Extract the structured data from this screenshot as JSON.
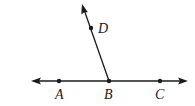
{
  "diagram": {
    "type": "geometry-lines-angle",
    "line_color": "#1a1a1a",
    "points": [
      {
        "name": "A",
        "label": "A",
        "x": 59,
        "y": 81,
        "label_x": 55,
        "label_y": 99
      },
      {
        "name": "B",
        "label": "B",
        "x": 109,
        "y": 81,
        "label_x": 104,
        "label_y": 99
      },
      {
        "name": "C",
        "label": "C",
        "x": 160,
        "y": 81,
        "label_x": 155,
        "label_y": 99
      },
      {
        "name": "D",
        "label": "D",
        "x": 91,
        "y": 28,
        "label_x": 98,
        "label_y": 33
      }
    ],
    "line_AC": {
      "x1": 31,
      "y1": 81,
      "x2": 188,
      "y2": 81,
      "arrows": "both"
    },
    "ray_BD": {
      "x1": 109,
      "y1": 81,
      "x2": 82,
      "y2": 4,
      "arrows": "end"
    }
  }
}
